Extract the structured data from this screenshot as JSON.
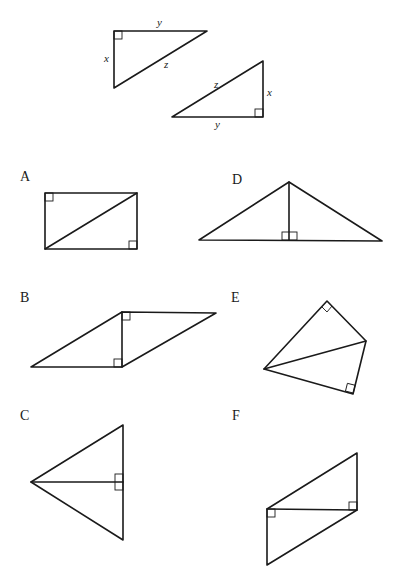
{
  "reference_triangles": {
    "triangle_1": {
      "sides": {
        "x": "x",
        "y": "y",
        "z": "z"
      }
    },
    "triangle_2": {
      "sides": {
        "x": "x",
        "y": "y",
        "z": "z"
      }
    }
  },
  "figures": [
    {
      "label": "A",
      "description": "rectangle split by a diagonal into two right triangles"
    },
    {
      "label": "B",
      "description": "parallelogram split by a vertical segment into two right triangles"
    },
    {
      "label": "C",
      "description": "kite-like triangle split by a horizontal altitude"
    },
    {
      "label": "D",
      "description": "isosceles triangle split by a vertical altitude"
    },
    {
      "label": "E",
      "description": "quadrilateral split by a diagonal into two right triangles"
    },
    {
      "label": "F",
      "description": "parallelogram split by a horizontal segment into two right triangles"
    }
  ],
  "colors": {
    "line": "#1a1a1a",
    "background": "#ffffff"
  }
}
